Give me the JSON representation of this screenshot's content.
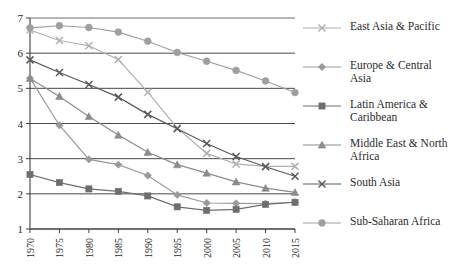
{
  "chart_data": {
    "type": "line",
    "title": "",
    "subtitle": "",
    "xlabel": "",
    "ylabel": "",
    "x": [
      1970,
      1975,
      1980,
      1985,
      1990,
      1995,
      2000,
      2005,
      2010,
      2015
    ],
    "xtick_labels": [
      "1970",
      "1975",
      "1980",
      "1985",
      "1990",
      "1995",
      "2000",
      "2005",
      "2010",
      "2015"
    ],
    "ytick_labels": [
      "1",
      "2",
      "3",
      "4",
      "5",
      "6",
      "7"
    ],
    "yticks": [
      1,
      2,
      3,
      4,
      5,
      6,
      7
    ],
    "ylim": [
      1,
      7
    ],
    "xlim": [
      1970,
      2015
    ],
    "grid": "horizontal",
    "legend_position": "right",
    "series": [
      {
        "name": "East Asia & Pacific",
        "marker": "x",
        "color": "#b0b0b0",
        "values": [
          6.66,
          6.36,
          6.21,
          5.82,
          4.89,
          3.87,
          3.15,
          2.85,
          2.78,
          2.78
        ]
      },
      {
        "name": "Europe & Central Asia",
        "marker": "diamond",
        "color": "#9a9a9a",
        "values": [
          5.29,
          3.95,
          2.98,
          2.83,
          2.52,
          1.97,
          1.74,
          1.73,
          1.72,
          1.76
        ]
      },
      {
        "name": "Latin America &\nCaribbean",
        "marker": "square",
        "color": "#6e6e6e",
        "values": [
          2.55,
          2.32,
          2.14,
          2.07,
          1.94,
          1.63,
          1.53,
          1.56,
          1.7,
          1.76
        ]
      },
      {
        "name": "Middle East & North\nAfrica",
        "marker": "triangle",
        "color": "#8c8c8c",
        "values": [
          5.28,
          4.77,
          4.2,
          3.67,
          3.18,
          2.83,
          2.59,
          2.34,
          2.16,
          2.04
        ]
      },
      {
        "name": "South Asia",
        "marker": "x",
        "color": "#5a5a5a",
        "values": [
          5.81,
          5.45,
          5.11,
          4.75,
          4.26,
          3.85,
          3.43,
          3.06,
          2.77,
          2.5
        ]
      },
      {
        "name": "Sub-Saharan Africa",
        "marker": "circle",
        "color": "#9f9f9f",
        "values": [
          6.72,
          6.78,
          6.73,
          6.6,
          6.34,
          6.02,
          5.77,
          5.51,
          5.21,
          4.88
        ]
      }
    ]
  },
  "legend": {
    "items": [
      {
        "label": "East Asia & Pacific"
      },
      {
        "label": "Europe & Central Asia"
      },
      {
        "label": "Latin America &\nCaribbean"
      },
      {
        "label": "Middle East & North\nAfrica"
      },
      {
        "label": "South Asia"
      },
      {
        "label": "Sub-Saharan Africa"
      }
    ]
  },
  "caption": {
    "text": ""
  }
}
